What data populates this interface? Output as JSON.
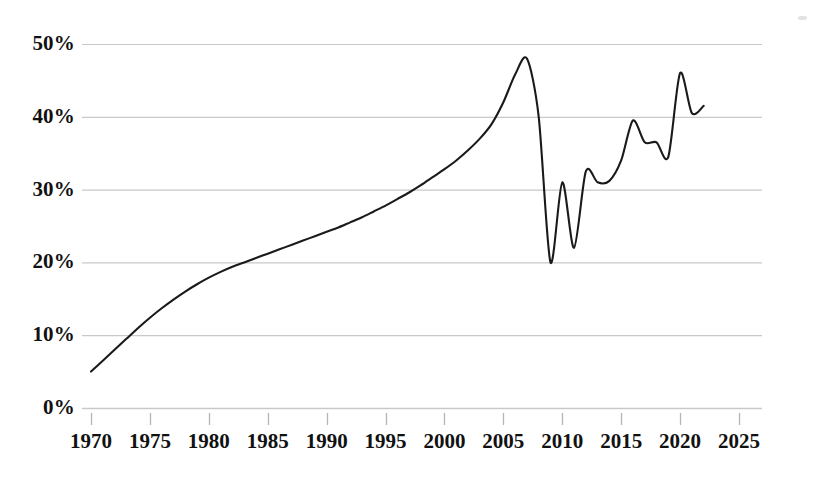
{
  "chart_data": {
    "type": "line",
    "title": "",
    "subtitle": "",
    "xlabel": "",
    "ylabel": "",
    "xlim": [
      1970,
      2026.5
    ],
    "ylim": [
      0,
      50
    ],
    "grid": true,
    "grid_axis": "y",
    "legend": false,
    "legend_position": "none",
    "y_tick_labels": [
      "0%",
      "10%",
      "20%",
      "30%",
      "40%",
      "50%"
    ],
    "y_tick_values": [
      0,
      10,
      20,
      30,
      40,
      50
    ],
    "x_tick_labels": [
      "1970",
      "1975",
      "1980",
      "1985",
      "1990",
      "1995",
      "2000",
      "2005",
      "2010",
      "2015",
      "2020",
      "2025"
    ],
    "x_tick_values": [
      1970,
      1975,
      1980,
      1985,
      1990,
      1995,
      2000,
      2005,
      2010,
      2015,
      2020,
      2025
    ],
    "series": [
      {
        "name": "",
        "style": "solid-thin-dark",
        "color": "#1a1a1a",
        "x": [
          1970,
          1971,
          1972,
          1973,
          1974,
          1975,
          1976,
          1977,
          1978,
          1979,
          1980,
          1981,
          1982,
          1983,
          1984,
          1985,
          1986,
          1987,
          1988,
          1989,
          1990,
          1991,
          1992,
          1993,
          1994,
          1995,
          1996,
          1997,
          1998,
          1999,
          2000,
          2001,
          2002,
          2003,
          2004,
          2005,
          2006,
          2007,
          2008,
          2009,
          2010,
          2011,
          2012,
          2013,
          2014,
          2015,
          2016,
          2017,
          2018,
          2019,
          2020,
          2021,
          2022
        ],
        "values": [
          5.0,
          6.5,
          8.0,
          9.5,
          11.0,
          12.4,
          13.7,
          14.9,
          16.0,
          17.0,
          17.9,
          18.7,
          19.4,
          20.0,
          20.6,
          21.2,
          21.8,
          22.4,
          23.0,
          23.6,
          24.2,
          24.8,
          25.5,
          26.2,
          27.0,
          27.8,
          28.7,
          29.6,
          30.6,
          31.7,
          32.8,
          34.0,
          35.4,
          37.0,
          39.0,
          42.0,
          45.8,
          48.0,
          40.0,
          20.0,
          31.0,
          22.0,
          32.5,
          31.0,
          31.2,
          34.0,
          39.5,
          36.5,
          36.5,
          34.5,
          46.0,
          40.5,
          41.5
        ]
      }
    ],
    "annotations": [
      {
        "name": "peak-2007",
        "x": 2007,
        "y": 48.0,
        "label": ""
      },
      {
        "name": "trough-2009",
        "x": 2009,
        "y": 20.0,
        "label": ""
      },
      {
        "name": "peak-2020",
        "x": 2020,
        "y": 46.0,
        "label": ""
      }
    ]
  },
  "axes": {
    "plot_left_px": 91,
    "plot_right_px": 762,
    "plot_top_px": 44,
    "plot_bottom_px": 408,
    "gridline_color": "#c9c9c9",
    "tick_color": "#b5b5b5",
    "line_color": "#1a1a1a"
  }
}
